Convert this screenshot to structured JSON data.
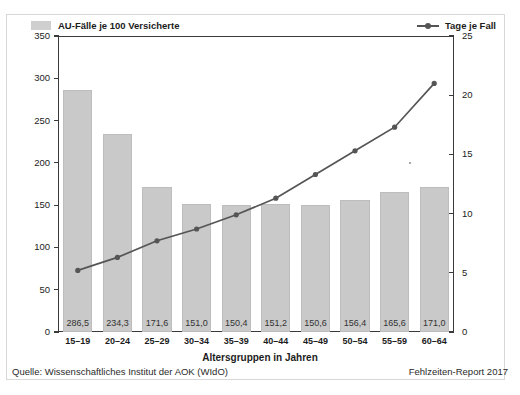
{
  "legend": {
    "bars_label": "AU-Fälle je 100 Versicherte",
    "line_label": "Tage je Fall",
    "bar_swatch_name": "bar-legend-swatch",
    "line_marker_name": "line-legend-marker"
  },
  "axes": {
    "x_title": "Altersgruppen in Jahren",
    "left_ticks": [
      "0",
      "50",
      "100",
      "150",
      "200",
      "250",
      "300",
      "350"
    ],
    "right_ticks": [
      "0",
      "5",
      "10",
      "15",
      "20",
      "25"
    ]
  },
  "footer": {
    "source": "Quelle: Wissenschaftliches Institut der AOK (WIdO)",
    "report": "Fehlzeiten-Report 2017"
  },
  "colors": {
    "bar_fill": "#c9c9c9",
    "line_stroke": "#555555",
    "axis": "#3a3a3a",
    "frame": "#d8d8d8",
    "background": "#ffffff"
  },
  "chart_data": {
    "type": "bar",
    "title": "",
    "xlabel": "Altersgruppen in Jahren",
    "ylabel": "",
    "categories": [
      "15–19",
      "20–24",
      "25–29",
      "30–34",
      "35–39",
      "40–44",
      "45–49",
      "50–54",
      "55–59",
      "60–64"
    ],
    "series": [
      {
        "name": "AU-Fälle je 100 Versicherte",
        "type": "bar",
        "axis": "left",
        "values": [
          286.5,
          234.3,
          171.6,
          151.0,
          150.4,
          151.2,
          150.6,
          156.4,
          165.6,
          171.0
        ],
        "labels": [
          "286,5",
          "234,3",
          "171,6",
          "151,0",
          "150,4",
          "151,2",
          "150,6",
          "156,4",
          "165,6",
          "171,0"
        ],
        "ylim": [
          0,
          350
        ],
        "ytick_step": 50
      },
      {
        "name": "Tage je Fall",
        "type": "line",
        "axis": "right",
        "values": [
          5.2,
          6.3,
          7.7,
          8.7,
          9.9,
          11.3,
          13.3,
          15.3,
          17.3,
          21.0
        ],
        "ylim": [
          0,
          25
        ],
        "ytick_step": 5
      }
    ],
    "grid": false,
    "legend_position": "top"
  }
}
